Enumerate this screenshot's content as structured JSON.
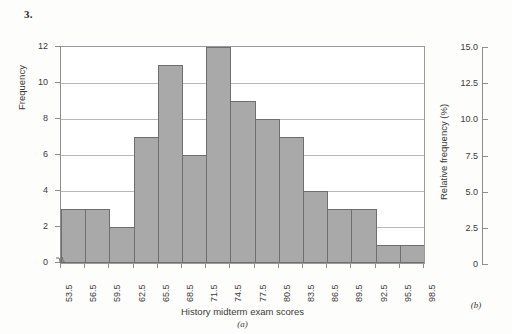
{
  "problem": {
    "number": "3."
  },
  "panel_a": {
    "caption": "(a)",
    "xlabel": "History midterm exam scores",
    "ylabel": "Frequency"
  },
  "panel_b": {
    "caption": "(b)",
    "ylabel": "Relative frequency (%)"
  },
  "colors": {
    "bar_fill": "#a9a9a9",
    "bar_stroke": "#6e6e6e",
    "gridline": "#b9b9b9",
    "axis": "#8d8d8d",
    "text": "#3a3a3a",
    "page_background": "#fdfdfb"
  },
  "chart_data": {
    "type": "bar",
    "title": "",
    "xlabel": "History midterm exam scores",
    "ylabel": "Frequency",
    "ylim": [
      0,
      12
    ],
    "yticks": [
      0,
      2,
      4,
      6,
      8,
      10,
      12
    ],
    "ytick_labels": [
      "0",
      "2",
      "4",
      "6",
      "8",
      "10",
      "12"
    ],
    "grid": true,
    "legend": "none",
    "bin_edges": [
      53.5,
      56.5,
      59.5,
      62.5,
      65.5,
      68.5,
      71.5,
      74.5,
      77.5,
      80.5,
      83.5,
      86.5,
      89.5,
      92.5,
      95.5,
      98.5
    ],
    "xtick_labels": [
      "53.5",
      "56.5",
      "59.5",
      "62.5",
      "65.5",
      "68.5",
      "71.5",
      "74.5",
      "77.5",
      "80.5",
      "83.5",
      "86.5",
      "89.5",
      "92.5",
      "95.5",
      "98.5"
    ],
    "categories": [
      "53.5-56.5",
      "56.5-59.5",
      "59.5-62.5",
      "62.5-65.5",
      "65.5-68.5",
      "68.5-71.5",
      "71.5-74.5",
      "74.5-77.5",
      "77.5-80.5",
      "80.5-83.5",
      "83.5-86.5",
      "86.5-89.5",
      "89.5-92.5",
      "92.5-95.5",
      "95.5-98.5"
    ],
    "values": [
      3,
      3,
      2,
      7,
      11,
      6,
      12,
      9,
      8,
      7,
      4,
      3,
      3,
      1,
      1
    ],
    "secondary_axis": {
      "label": "Relative frequency (%)",
      "ylim": [
        0,
        15
      ],
      "ticks": [
        0,
        2.5,
        5.0,
        7.5,
        10.0,
        12.5,
        15.0
      ],
      "tick_labels": [
        "0",
        "2.5",
        "5.0",
        "7.5",
        "10.0",
        "12.5",
        "15.0"
      ]
    }
  }
}
